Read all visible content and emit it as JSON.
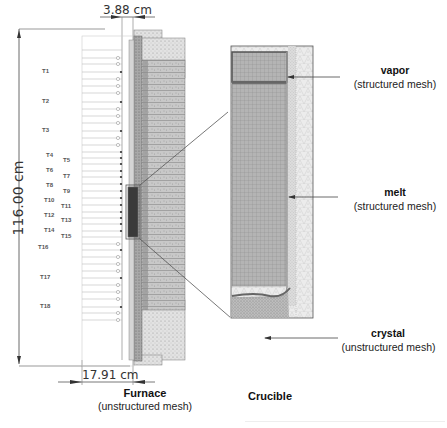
{
  "furnace": {
    "title": "Furnace",
    "subtitle": "(unstructured mesh)",
    "dimensions": {
      "height_label": "116.00 cm",
      "top_width_label": "3.88 cm",
      "bottom_width_label": "17.91 cm"
    },
    "thermocouples": [
      {
        "id": "T1",
        "x": 42,
        "y": 72
      },
      {
        "id": "T2",
        "x": 42,
        "y": 102
      },
      {
        "id": "T3",
        "x": 42,
        "y": 131
      },
      {
        "id": "T4",
        "x": 46,
        "y": 156
      },
      {
        "id": "T5",
        "x": 63,
        "y": 161
      },
      {
        "id": "T6",
        "x": 46,
        "y": 171
      },
      {
        "id": "T7",
        "x": 63,
        "y": 177
      },
      {
        "id": "T8",
        "x": 46,
        "y": 186
      },
      {
        "id": "T9",
        "x": 63,
        "y": 192
      },
      {
        "id": "T10",
        "x": 44,
        "y": 201
      },
      {
        "id": "T11",
        "x": 61,
        "y": 207
      },
      {
        "id": "T12",
        "x": 44,
        "y": 216
      },
      {
        "id": "T13",
        "x": 61,
        "y": 221
      },
      {
        "id": "T14",
        "x": 44,
        "y": 231
      },
      {
        "id": "T15",
        "x": 61,
        "y": 237
      },
      {
        "id": "T16",
        "x": 38,
        "y": 248
      },
      {
        "id": "T17",
        "x": 40,
        "y": 278
      },
      {
        "id": "T18",
        "x": 40,
        "y": 307
      }
    ]
  },
  "crucible": {
    "title": "Crucible",
    "regions": [
      {
        "name": "vapor",
        "mesh": "(structured mesh)"
      },
      {
        "name": "melt",
        "mesh": "(structured mesh)"
      },
      {
        "name": "crystal",
        "mesh": "(unstructured mesh)"
      }
    ]
  },
  "colors": {
    "mesh_dark": "#5a5a5a",
    "mesh_mid": "#9a9a9a",
    "mesh_light": "#d8d8d8",
    "line": "#444444"
  }
}
